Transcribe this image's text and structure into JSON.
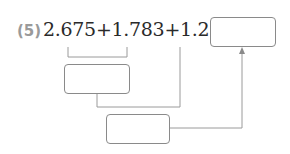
{
  "problem": {
    "number_label": "(5)",
    "expression": "2.675+1.783+1.2=",
    "terms": [
      "2.675",
      "1.783",
      "1.2"
    ],
    "answer_box": "",
    "step1_box": "",
    "step2_box": ""
  },
  "colors": {
    "line": "#9a9a9a",
    "box_border": "#8a8a8a",
    "text": "#2a2a2a",
    "label": "#9a9a9a"
  }
}
